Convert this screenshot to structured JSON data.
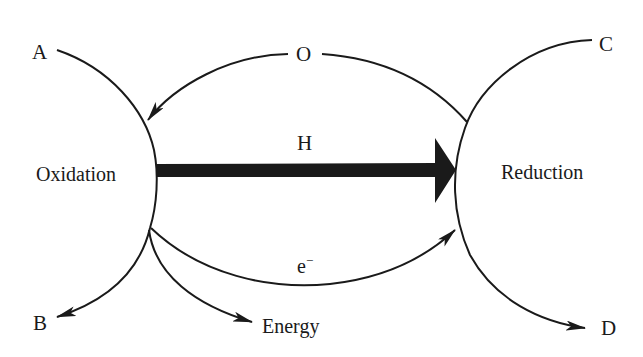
{
  "diagram": {
    "labels": {
      "A": "A",
      "B": "B",
      "C": "C",
      "D": "D",
      "O": "O",
      "H": "H",
      "electron": "e",
      "electron_sup": "−",
      "energy": "Energy",
      "oxidation": "Oxidation",
      "reduction": "Reduction"
    },
    "colors": {
      "stroke": "#1a1a1a",
      "background": "#ffffff"
    },
    "nodes": [
      {
        "id": "oxidation",
        "label": "Oxidation"
      },
      {
        "id": "reduction",
        "label": "Reduction"
      },
      {
        "id": "A",
        "label": "A"
      },
      {
        "id": "B",
        "label": "B"
      },
      {
        "id": "C",
        "label": "C"
      },
      {
        "id": "D",
        "label": "D"
      },
      {
        "id": "energy",
        "label": "Energy"
      }
    ],
    "edges": [
      {
        "from": "A",
        "to": "B",
        "via": "oxidation",
        "style": "curve"
      },
      {
        "from": "C",
        "to": "D",
        "via": "reduction",
        "style": "curve"
      },
      {
        "from": "reduction",
        "to": "oxidation",
        "label": "O",
        "style": "curved-arrow"
      },
      {
        "from": "oxidation",
        "to": "reduction",
        "label": "H",
        "style": "thick-arrow"
      },
      {
        "from": "oxidation",
        "to": "reduction",
        "label": "e−",
        "style": "curved-arrow"
      },
      {
        "from": "oxidation",
        "to": "energy",
        "style": "curved-arrow"
      }
    ]
  }
}
